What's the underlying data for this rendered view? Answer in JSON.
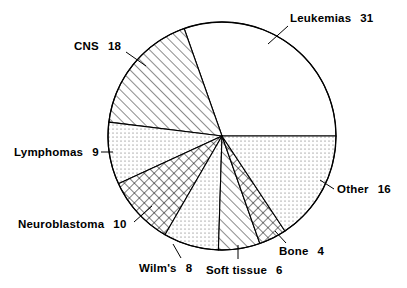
{
  "chart_data": {
    "type": "pie",
    "title": "",
    "subtitle": "",
    "xlabel": "",
    "ylabel": "",
    "legend_position": "none",
    "grid": false,
    "total": 102,
    "units": "percent",
    "start_angle_deg": 0,
    "direction": "counterclockwise",
    "center": {
      "x": 222,
      "y": 136
    },
    "radius": 114,
    "categories": [
      "Leukemias",
      "CNS",
      "Lymphomas",
      "Neuroblastoma",
      "Wilm's",
      "Soft tissue",
      "Bone",
      "Other"
    ],
    "values": [
      31,
      18,
      9,
      10,
      8,
      6,
      4,
      16
    ],
    "slices": [
      {
        "label": "Leukemias",
        "value": 31,
        "value_text": "31",
        "fill": "blank",
        "start_deg": 0,
        "end_deg": 109.4,
        "label_pos": {
          "x": 290,
          "y": 12
        },
        "leader": {
          "x1": 288,
          "y1": 26,
          "x2": 268,
          "y2": 44
        }
      },
      {
        "label": "CNS",
        "value": 18,
        "value_text": "18",
        "fill": "diagonal-hatch",
        "start_deg": 109.4,
        "end_deg": 173.0,
        "label_pos": {
          "x": 74,
          "y": 40
        },
        "leader": {
          "x1": 126,
          "y1": 52,
          "x2": 146,
          "y2": 66
        }
      },
      {
        "label": "Lymphomas",
        "value": 9,
        "value_text": "9",
        "fill": "dots",
        "start_deg": 173.0,
        "end_deg": 204.7,
        "label_pos": {
          "x": 14,
          "y": 146
        },
        "leader": {
          "x1": 101,
          "y1": 152,
          "x2": 113,
          "y2": 152
        }
      },
      {
        "label": "Neuroblastoma",
        "value": 10,
        "value_text": "10",
        "fill": "cross-hatch",
        "start_deg": 204.7,
        "end_deg": 240.0,
        "label_pos": {
          "x": 18,
          "y": 218
        },
        "leader": {
          "x1": 134,
          "y1": 222,
          "x2": 152,
          "y2": 206
        }
      },
      {
        "label": "Wilm's",
        "value": 8,
        "value_text": "8",
        "fill": "dots",
        "start_deg": 240.0,
        "end_deg": 268.2,
        "label_pos": {
          "x": 139,
          "y": 262
        },
        "leader": {
          "x1": 181,
          "y1": 258,
          "x2": 173,
          "y2": 244
        }
      },
      {
        "label": "Soft tissue",
        "value": 6,
        "value_text": "6",
        "fill": "diagonal-hatch",
        "start_deg": 268.2,
        "end_deg": 289.4,
        "label_pos": {
          "x": 206,
          "y": 264
        },
        "leader": {
          "x1": 238,
          "y1": 259,
          "x2": 238,
          "y2": 245
        }
      },
      {
        "label": "Bone",
        "value": 4,
        "value_text": "4",
        "fill": "cross-hatch",
        "start_deg": 289.4,
        "end_deg": 303.5,
        "label_pos": {
          "x": 279,
          "y": 245
        },
        "leader": {
          "x1": 286,
          "y1": 243,
          "x2": 275,
          "y2": 231
        }
      },
      {
        "label": "Other",
        "value": 16,
        "value_text": "16",
        "fill": "dots",
        "start_deg": 303.5,
        "end_deg": 360.0,
        "label_pos": {
          "x": 337,
          "y": 183
        },
        "leader": {
          "x1": 334,
          "y1": 189,
          "x2": 320,
          "y2": 180
        }
      }
    ]
  },
  "colors": {
    "stroke": "#000000",
    "background": "#ffffff",
    "text": "#000000"
  }
}
